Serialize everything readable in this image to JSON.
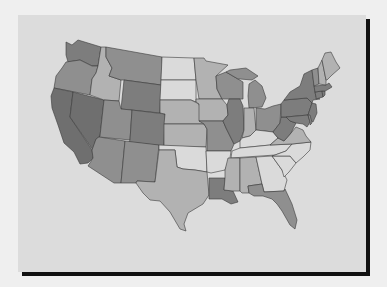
{
  "map": {
    "type": "choropleth",
    "region": "Contiguous United States",
    "legend": null,
    "shades": {
      "darkest": "#6f6f6f",
      "dark": "#7d7d7d",
      "medium": "#8f8f8f",
      "light": "#b2b2b2",
      "lightest": "#dadada"
    },
    "colors": {
      "page_background": "#efefef",
      "panel_background": "#dcdcdc",
      "panel_shadow": "#111111",
      "state_border": "#3a3a3a"
    },
    "states": [
      {
        "abbr": "WA",
        "shade": "dark"
      },
      {
        "abbr": "OR",
        "shade": "medium"
      },
      {
        "abbr": "CA",
        "shade": "darkest"
      },
      {
        "abbr": "NV",
        "shade": "darkest"
      },
      {
        "abbr": "ID",
        "shade": "light"
      },
      {
        "abbr": "MT",
        "shade": "medium"
      },
      {
        "abbr": "WY",
        "shade": "dark"
      },
      {
        "abbr": "UT",
        "shade": "medium"
      },
      {
        "abbr": "CO",
        "shade": "dark"
      },
      {
        "abbr": "AZ",
        "shade": "medium"
      },
      {
        "abbr": "NM",
        "shade": "medium"
      },
      {
        "abbr": "ND",
        "shade": "lightest"
      },
      {
        "abbr": "SD",
        "shade": "lightest"
      },
      {
        "abbr": "NE",
        "shade": "light"
      },
      {
        "abbr": "KS",
        "shade": "light"
      },
      {
        "abbr": "OK",
        "shade": "lightest"
      },
      {
        "abbr": "TX",
        "shade": "light"
      },
      {
        "abbr": "MN",
        "shade": "light"
      },
      {
        "abbr": "IA",
        "shade": "light"
      },
      {
        "abbr": "MO",
        "shade": "medium"
      },
      {
        "abbr": "AR",
        "shade": "lightest"
      },
      {
        "abbr": "LA",
        "shade": "dark"
      },
      {
        "abbr": "WI",
        "shade": "medium"
      },
      {
        "abbr": "IL",
        "shade": "dark"
      },
      {
        "abbr": "MI",
        "shade": "medium"
      },
      {
        "abbr": "IN",
        "shade": "light"
      },
      {
        "abbr": "OH",
        "shade": "medium"
      },
      {
        "abbr": "KY",
        "shade": "lightest"
      },
      {
        "abbr": "TN",
        "shade": "lightest"
      },
      {
        "abbr": "MS",
        "shade": "light"
      },
      {
        "abbr": "AL",
        "shade": "light"
      },
      {
        "abbr": "GA",
        "shade": "lightest"
      },
      {
        "abbr": "FL",
        "shade": "medium"
      },
      {
        "abbr": "SC",
        "shade": "lightest"
      },
      {
        "abbr": "NC",
        "shade": "lightest"
      },
      {
        "abbr": "VA",
        "shade": "light"
      },
      {
        "abbr": "WV",
        "shade": "dark"
      },
      {
        "abbr": "PA",
        "shade": "dark"
      },
      {
        "abbr": "NY",
        "shade": "dark"
      },
      {
        "abbr": "NJ",
        "shade": "dark"
      },
      {
        "abbr": "MD",
        "shade": "dark"
      },
      {
        "abbr": "DE",
        "shade": "medium"
      },
      {
        "abbr": "CT",
        "shade": "dark"
      },
      {
        "abbr": "RI",
        "shade": "dark"
      },
      {
        "abbr": "MA",
        "shade": "dark"
      },
      {
        "abbr": "VT",
        "shade": "medium"
      },
      {
        "abbr": "NH",
        "shade": "light"
      },
      {
        "abbr": "ME",
        "shade": "light"
      }
    ]
  }
}
